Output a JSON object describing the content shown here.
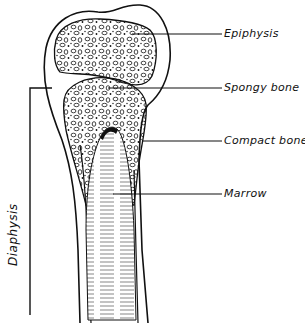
{
  "diagram": {
    "labels": [
      {
        "id": "epiphysis",
        "text": "Epiphysis"
      },
      {
        "id": "spongy-bone",
        "text": "Spongy bone"
      },
      {
        "id": "compact-bone",
        "text": "Compact bone"
      },
      {
        "id": "marrow",
        "text": "Marrow"
      }
    ],
    "bracket_label": "Diaphysis",
    "colors": {
      "ink": "#111111",
      "background": "#ffffff"
    }
  }
}
